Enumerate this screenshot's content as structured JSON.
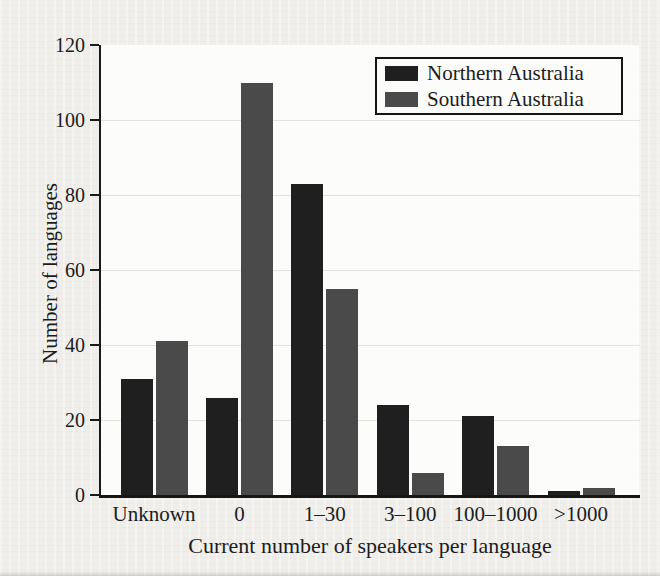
{
  "chart_data": {
    "type": "bar",
    "title": "",
    "xlabel": "Current number of speakers per language",
    "ylabel": "Number of languages",
    "categories": [
      "Unknown",
      "0",
      "1–30",
      "3–100",
      "100–1000",
      ">1000"
    ],
    "series": [
      {
        "name": "Northern Australia",
        "color": "#1f1f1f",
        "values": [
          31,
          26,
          83,
          24,
          21,
          1
        ]
      },
      {
        "name": "Southern Australia",
        "color": "#4a4a4a",
        "values": [
          41,
          110,
          55,
          6,
          13,
          2
        ]
      }
    ],
    "ylim": [
      0,
      120
    ],
    "yticks": [
      0,
      20,
      40,
      60,
      80,
      100,
      120
    ],
    "grid": true,
    "legend_position": "top-right"
  }
}
